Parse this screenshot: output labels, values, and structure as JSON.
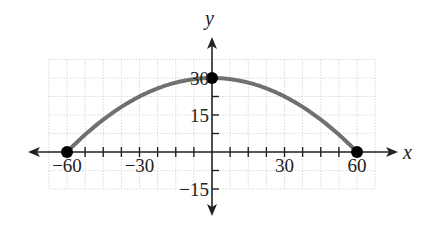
{
  "chart_data": {
    "type": "line",
    "title": "",
    "xlabel": "x",
    "ylabel": "y",
    "xlim": [
      -67.5,
      67.5
    ],
    "ylim": [
      -15,
      37.5
    ],
    "grid": true,
    "grid_step": 7.5,
    "x_ticks": [
      -60,
      -30,
      30,
      60
    ],
    "y_ticks": [
      30,
      15,
      -15
    ],
    "x_tick_labels": [
      "−60",
      "−30",
      "30",
      "60"
    ],
    "y_tick_labels": [
      "30",
      "15",
      "−15"
    ],
    "series": [
      {
        "name": "parabola",
        "equation": "y = 30 - x^2/120",
        "x": [
          -60,
          -45,
          -30,
          -15,
          0,
          15,
          30,
          45,
          60
        ],
        "values": [
          0,
          13.125,
          22.5,
          28.125,
          30,
          28.125,
          22.5,
          13.125,
          0
        ]
      }
    ],
    "points": [
      {
        "x": -60,
        "y": 0
      },
      {
        "x": 0,
        "y": 30
      },
      {
        "x": 60,
        "y": 0
      }
    ],
    "legend": null
  },
  "colors": {
    "curve": "#707070",
    "axis": "#222222",
    "grid": "#d8d8d8",
    "point": "#000000"
  }
}
